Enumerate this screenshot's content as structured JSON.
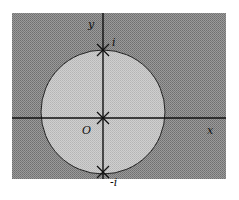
{
  "diagram": {
    "type": "complex-plane-region",
    "axes": {
      "x_label": "x",
      "y_label": "y",
      "origin_label": "O"
    },
    "region": {
      "shape": "circle",
      "center": "O",
      "description": "unit disk (lighter shading) inside shaded plane"
    },
    "points": [
      {
        "label": "i",
        "position": "top of circle on y-axis",
        "marker": "x"
      },
      {
        "label": "",
        "position": "origin",
        "marker": "x"
      },
      {
        "label": "-i",
        "position": "bottom of circle on y-axis",
        "marker": "x"
      }
    ],
    "colors": {
      "outer_fill": "#8a8a8a",
      "inner_fill": "#c4c4c4",
      "lines": "#111111",
      "background": "#ffffff"
    }
  }
}
